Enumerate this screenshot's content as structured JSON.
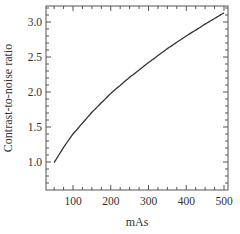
{
  "chart_data": {
    "type": "line",
    "title": "",
    "xlabel": "mAs",
    "ylabel": "Contrast-to-noise ratio",
    "xlim": [
      25,
      510
    ],
    "ylim": [
      0.6,
      3.23
    ],
    "xticks": [
      100,
      200,
      300,
      400,
      500
    ],
    "xtick_labels": [
      "100",
      "200",
      "300",
      "400",
      "500"
    ],
    "yticks": [
      1.0,
      1.5,
      2.0,
      2.5,
      3.0
    ],
    "ytick_labels": [
      "1.0",
      "1.5",
      "2.0",
      "2.5",
      "3.0"
    ],
    "grid": false,
    "legend": null,
    "series": [
      {
        "name": "CNR",
        "color": "#333333",
        "x": [
          50,
          75,
          100,
          150,
          200,
          250,
          300,
          350,
          400,
          450,
          500
        ],
        "y": [
          0.99,
          1.21,
          1.4,
          1.71,
          1.98,
          2.21,
          2.42,
          2.62,
          2.8,
          2.97,
          3.13
        ]
      }
    ]
  }
}
